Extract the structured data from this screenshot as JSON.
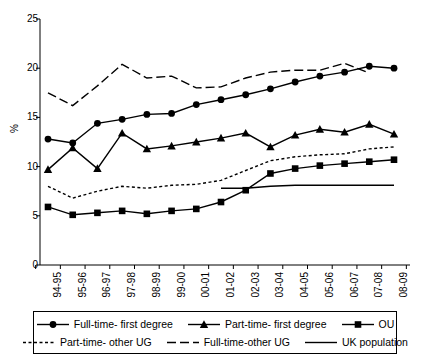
{
  "chart_data": {
    "type": "line",
    "title": "",
    "xlabel": "",
    "ylabel": "%",
    "ylim": [
      0,
      25
    ],
    "yticks": [
      0,
      5,
      10,
      15,
      20,
      25
    ],
    "grid": false,
    "legend_position": "bottom",
    "categories": [
      "94-95",
      "95-96",
      "96-97",
      "97-98",
      "98-99",
      "99-00",
      "00-01",
      "01-02",
      "02-03",
      "03-04",
      "04-05",
      "05-06",
      "06-07",
      "07-08",
      "08-09"
    ],
    "series": [
      {
        "name": "Full-time- first degree",
        "marker": "circle",
        "line_style": "solid",
        "values": [
          12.8,
          12.4,
          14.4,
          14.8,
          15.3,
          15.4,
          16.3,
          16.8,
          17.3,
          17.9,
          18.6,
          19.2,
          19.6,
          20.2,
          20.0
        ]
      },
      {
        "name": "Part-time- first degree",
        "marker": "triangle",
        "line_style": "solid",
        "values": [
          9.7,
          11.9,
          9.8,
          13.4,
          11.8,
          12.1,
          12.5,
          12.9,
          13.4,
          12.0,
          13.2,
          13.8,
          13.5,
          14.3,
          13.3
        ]
      },
      {
        "name": "OU",
        "marker": "square",
        "line_style": "solid",
        "values": [
          5.9,
          5.1,
          5.3,
          5.5,
          5.2,
          5.5,
          5.7,
          6.4,
          7.6,
          9.3,
          9.8,
          10.1,
          10.3,
          10.5,
          10.7
        ]
      },
      {
        "name": "Part-time- other UG",
        "marker": "none",
        "line_style": "dotted",
        "values": [
          8.0,
          6.8,
          7.5,
          8.0,
          7.8,
          8.1,
          8.2,
          8.6,
          9.6,
          10.6,
          11.0,
          11.2,
          11.3,
          11.8,
          12.0
        ]
      },
      {
        "name": "Full-time-other UG",
        "marker": "none",
        "line_style": "dashed",
        "values": [
          17.5,
          16.2,
          18.2,
          20.4,
          19.0,
          19.2,
          18.0,
          18.1,
          19.0,
          19.6,
          19.8,
          19.8,
          20.5,
          19.5,
          null
        ]
      },
      {
        "name": "UK population",
        "marker": "none",
        "line_style": "plain",
        "values": [
          null,
          null,
          null,
          null,
          null,
          null,
          null,
          7.8,
          7.8,
          8.0,
          8.1,
          8.1,
          8.1,
          8.1,
          8.1
        ]
      }
    ]
  },
  "axis": {
    "y_label": "%",
    "y_ticks": [
      "0",
      "5",
      "10",
      "15",
      "20",
      "25"
    ],
    "x_ticks": [
      "94-95",
      "95-96",
      "96-97",
      "97-98",
      "98-99",
      "99-00",
      "00-01",
      "01-02",
      "02-03",
      "03-04",
      "04-05",
      "05-06",
      "06-07",
      "07-08",
      "08-09"
    ]
  },
  "legend": {
    "items": [
      {
        "label": "Full-time- first degree",
        "marker": "circle",
        "line_style": "solid"
      },
      {
        "label": "Part-time- first degree",
        "marker": "triangle",
        "line_style": "solid"
      },
      {
        "label": "OU",
        "marker": "square",
        "line_style": "solid"
      },
      {
        "label": "Part-time- other UG",
        "marker": "none",
        "line_style": "dotted"
      },
      {
        "label": "Full-time-other UG",
        "marker": "none",
        "line_style": "dashed"
      },
      {
        "label": "UK population",
        "marker": "none",
        "line_style": "plain"
      }
    ]
  },
  "colors": {
    "line": "#000000",
    "axis": "#000000",
    "background": "#ffffff"
  }
}
